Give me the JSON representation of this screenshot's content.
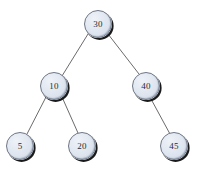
{
  "figure": {
    "kind": "binary-search-tree-diagram",
    "background_color": "#ffffff",
    "node_fill_color": "#dce4ee",
    "node_shadow_color": "#1a1a1a",
    "node_border_color": "#6e7786",
    "edge_color": "#6b6b6b",
    "label_color": "#2b2b2b"
  },
  "nodes": [
    {
      "id": "n30",
      "label": "30",
      "cx": 98,
      "cy": 24,
      "r": 14,
      "level": 0,
      "role": "root"
    },
    {
      "id": "n10",
      "label": "10",
      "cx": 54,
      "cy": 86,
      "r": 14,
      "level": 1,
      "role": "left-child"
    },
    {
      "id": "n40",
      "label": "40",
      "cx": 146,
      "cy": 86,
      "r": 14,
      "level": 1,
      "role": "right-child"
    },
    {
      "id": "n5",
      "label": "5",
      "cx": 20,
      "cy": 146,
      "r": 14,
      "level": 2,
      "role": "leaf"
    },
    {
      "id": "n20",
      "label": "20",
      "cx": 82,
      "cy": 146,
      "r": 14,
      "level": 2,
      "role": "leaf"
    },
    {
      "id": "n45",
      "label": "45",
      "cx": 174,
      "cy": 146,
      "r": 14,
      "level": 2,
      "role": "leaf"
    }
  ],
  "edges": [
    {
      "id": "e30-10",
      "from": "n30",
      "to": "n10",
      "x1": 88,
      "y1": 34,
      "x2": 62,
      "y2": 76
    },
    {
      "id": "e30-40",
      "from": "n30",
      "to": "n40",
      "x1": 108,
      "y1": 34,
      "x2": 139,
      "y2": 74
    },
    {
      "id": "e10-5",
      "from": "n10",
      "to": "n5",
      "x1": 46,
      "y1": 97,
      "x2": 27,
      "y2": 134
    },
    {
      "id": "e10-20",
      "from": "n10",
      "to": "n20",
      "x1": 62,
      "y1": 97,
      "x2": 78,
      "y2": 133
    },
    {
      "id": "e40-45",
      "from": "n40",
      "to": "n45",
      "x1": 151,
      "y1": 99,
      "x2": 170,
      "y2": 134
    }
  ]
}
